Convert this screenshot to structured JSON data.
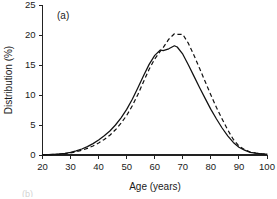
{
  "figure": {
    "panel_label": "(a)",
    "next_panel_label": "(b)"
  },
  "chart_data": {
    "type": "line",
    "title": "",
    "subtitle": "",
    "panel_label": "(a)",
    "xlabel": "Age (years)",
    "ylabel": "Distribution (%)",
    "xlim": [
      20,
      100
    ],
    "ylim": [
      0,
      25
    ],
    "xticks": [
      20,
      30,
      40,
      50,
      60,
      70,
      80,
      90,
      100
    ],
    "xticklabels": [
      "20",
      "30",
      "40",
      "50",
      "60",
      "70",
      "80",
      "90",
      "100"
    ],
    "yticks": [
      0,
      5,
      10,
      15,
      20,
      25
    ],
    "yticklabels": [
      "0",
      "5",
      "10",
      "15",
      "20",
      "25"
    ],
    "grid": false,
    "legend": null,
    "legend_position": "none",
    "x": [
      20,
      22,
      24,
      26,
      28,
      30,
      32,
      34,
      36,
      38,
      40,
      42,
      44,
      46,
      48,
      50,
      52,
      54,
      56,
      58,
      60,
      62,
      63,
      65,
      67,
      68,
      70,
      72,
      74,
      76,
      78,
      80,
      82,
      84,
      86,
      88,
      90,
      92,
      94,
      96,
      98,
      100
    ],
    "series": [
      {
        "name": "solid",
        "style": "solid",
        "color": "#111111",
        "values": [
          0.05,
          0.08,
          0.12,
          0.18,
          0.28,
          0.45,
          0.7,
          1.0,
          1.4,
          1.9,
          2.5,
          3.2,
          4.0,
          5.0,
          6.2,
          7.6,
          9.3,
          11.2,
          13.2,
          15.1,
          16.6,
          17.5,
          17.4,
          17.7,
          18.2,
          18.0,
          16.8,
          15.0,
          13.1,
          11.2,
          9.4,
          7.6,
          6.0,
          4.5,
          3.2,
          2.1,
          1.3,
          0.8,
          0.45,
          0.3,
          0.2,
          0.15
        ]
      },
      {
        "name": "dashed",
        "style": "dashed",
        "color": "#111111",
        "values": [
          0.04,
          0.06,
          0.09,
          0.14,
          0.22,
          0.35,
          0.55,
          0.8,
          1.1,
          1.5,
          2.0,
          2.6,
          3.3,
          4.2,
          5.3,
          6.6,
          8.2,
          10.1,
          12.2,
          14.3,
          16.0,
          17.3,
          17.9,
          19.3,
          20.2,
          20.1,
          20.1,
          18.6,
          16.6,
          14.4,
          12.2,
          10.0,
          7.9,
          6.0,
          4.2,
          2.6,
          1.5,
          0.9,
          0.5,
          0.32,
          0.22,
          0.16
        ]
      }
    ]
  }
}
